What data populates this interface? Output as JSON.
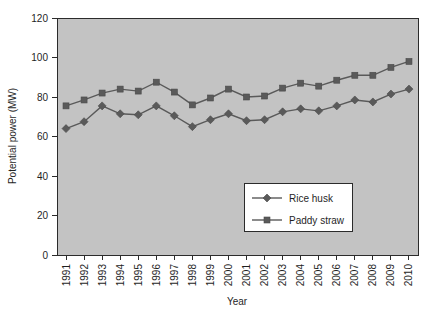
{
  "chart_data": {
    "type": "line",
    "title": "",
    "xlabel": "Year",
    "ylabel": "Potential power (MW)",
    "x": [
      1991,
      1992,
      1993,
      1994,
      1995,
      1996,
      1997,
      1998,
      1999,
      2000,
      2001,
      2002,
      2003,
      2004,
      2005,
      2006,
      2007,
      2008,
      2009,
      2010
    ],
    "categories": [
      "1991",
      "1992",
      "1993",
      "1994",
      "1995",
      "1996",
      "1997",
      "1998",
      "1999",
      "2000",
      "2001",
      "2002",
      "2003",
      "2004",
      "2005",
      "2006",
      "2007",
      "2008",
      "2009",
      "2010"
    ],
    "series": [
      {
        "name": "Rice husk",
        "marker": "diamond",
        "color": "#5a5a5a",
        "values": [
          64,
          67.5,
          75.5,
          71.5,
          71,
          75.5,
          70.5,
          65,
          68.5,
          71.5,
          68,
          68.5,
          72.5,
          74,
          73,
          75.5,
          78.5,
          77.5,
          81.5,
          84
        ]
      },
      {
        "name": "Paddy straw",
        "marker": "square",
        "color": "#5a5a5a",
        "values": [
          75.5,
          78.5,
          82,
          84,
          83,
          87.5,
          82.5,
          76,
          79.5,
          84,
          80,
          80.5,
          84.5,
          87,
          85.5,
          88.5,
          91,
          91,
          95,
          98
        ]
      }
    ],
    "ylim": [
      0,
      120
    ],
    "yticks": [
      0,
      20,
      40,
      60,
      80,
      100,
      120
    ],
    "ytick_labels": [
      "0",
      "20",
      "40",
      "60",
      "80",
      "100",
      "120"
    ],
    "grid": false,
    "legend_position": "center-right-inside",
    "plot_background": "#c3c3c3",
    "axis_color": "#2b2b2b"
  },
  "legend": {
    "entries": [
      {
        "label": "Rice husk"
      },
      {
        "label": "Paddy straw"
      }
    ]
  },
  "axes": {
    "x_title": "Year",
    "y_title": "Potential power (MW)"
  }
}
